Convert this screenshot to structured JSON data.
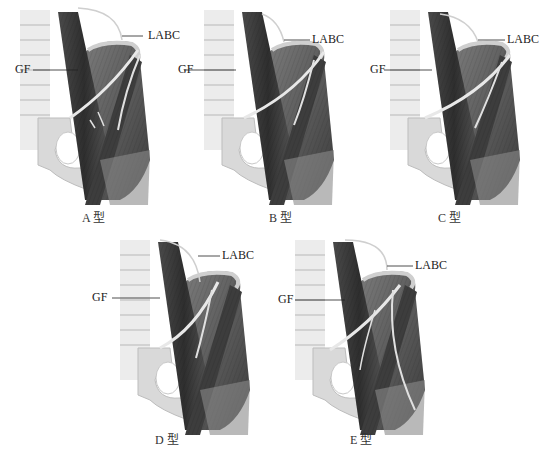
{
  "figure": {
    "panels": [
      {
        "id": "A",
        "caption": "A 型",
        "labels": {
          "gf": "GF",
          "labc": "LABC"
        }
      },
      {
        "id": "B",
        "caption": "B 型",
        "labels": {
          "gf": "GF",
          "labc": "LABC"
        }
      },
      {
        "id": "C",
        "caption": "C 型",
        "labels": {
          "gf": "GF",
          "labc": "LABC"
        }
      },
      {
        "id": "D",
        "caption": "D 型",
        "labels": {
          "gf": "GF",
          "labc": "LABC"
        }
      },
      {
        "id": "E",
        "caption": "E 型",
        "labels": {
          "gf": "GF",
          "labc": "LABC"
        }
      }
    ],
    "colors": {
      "muscle_dark": "#3a3a3a",
      "muscle_mid": "#6e6e6e",
      "bone": "#d8d8d8",
      "nerve": "#e6e6e6",
      "leader_line": "#222222"
    }
  }
}
